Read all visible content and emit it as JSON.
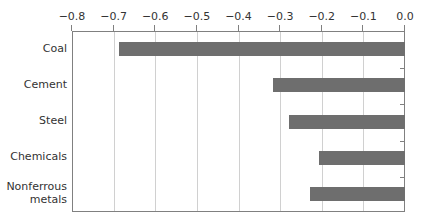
{
  "chart_data": {
    "type": "bar",
    "orientation": "horizontal",
    "title": "",
    "xlabel": "",
    "ylabel": "",
    "xlim": [
      -0.8,
      0.0
    ],
    "x_ticks": [
      "−0.8",
      "−0.7",
      "−0.6",
      "−0.5",
      "−0.4",
      "−0.3",
      "−0.2",
      "−0.1",
      "0.0"
    ],
    "x_axis_position": "top",
    "grid": "vertical",
    "categories": [
      "Coal",
      "Cement",
      "Steel",
      "Chemicals",
      "Nonferrous metals"
    ],
    "category_labels": [
      [
        "Coal"
      ],
      [
        "Cement"
      ],
      [
        "Steel"
      ],
      [
        "Chemicals"
      ],
      [
        "Nonferrous",
        "metals"
      ]
    ],
    "values": [
      -0.69,
      -0.32,
      -0.28,
      -0.21,
      -0.23
    ],
    "bar_color": "#6e6e6e"
  }
}
